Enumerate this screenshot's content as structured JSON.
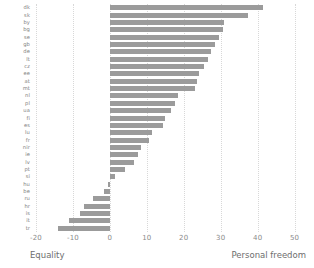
{
  "chart_data": {
    "type": "bar",
    "orientation": "horizontal",
    "title": "",
    "subtitle": "",
    "xlabel": "",
    "ylabel": "",
    "xlim": [
      -20,
      52
    ],
    "ylim": null,
    "grid": true,
    "legend": null,
    "bar_color": "#9b9b9b",
    "axis_left_caption": "Equality",
    "axis_right_caption": "Personal freedom",
    "xticks": [
      -20,
      -10,
      0,
      10,
      20,
      30,
      40,
      50
    ],
    "xtick_labels": [
      "-20",
      "-10",
      "0",
      "10",
      "20",
      "30",
      "40",
      "50"
    ],
    "categories": [
      "dk",
      "sk",
      "by",
      "bg",
      "se",
      "gb",
      "de",
      "lt",
      "cz",
      "ee",
      "at",
      "mt",
      "nl",
      "pl",
      "ua",
      "fi",
      "es",
      "lu",
      "fr",
      "nir",
      "ie",
      "lv",
      "pt",
      "si",
      "hu",
      "be",
      "ru",
      "hr",
      "is",
      "it",
      "tr"
    ],
    "values": [
      41.5,
      37.5,
      31.0,
      30.5,
      29.5,
      28.5,
      27.5,
      26.5,
      25.5,
      24.0,
      23.5,
      23.0,
      18.5,
      17.5,
      16.5,
      15.0,
      14.5,
      11.5,
      10.5,
      8.5,
      7.5,
      6.5,
      4.0,
      1.5,
      -0.5,
      -1.5,
      -4.5,
      -7.0,
      -8.0,
      -11.0,
      -14.0
    ],
    "annotations": []
  }
}
